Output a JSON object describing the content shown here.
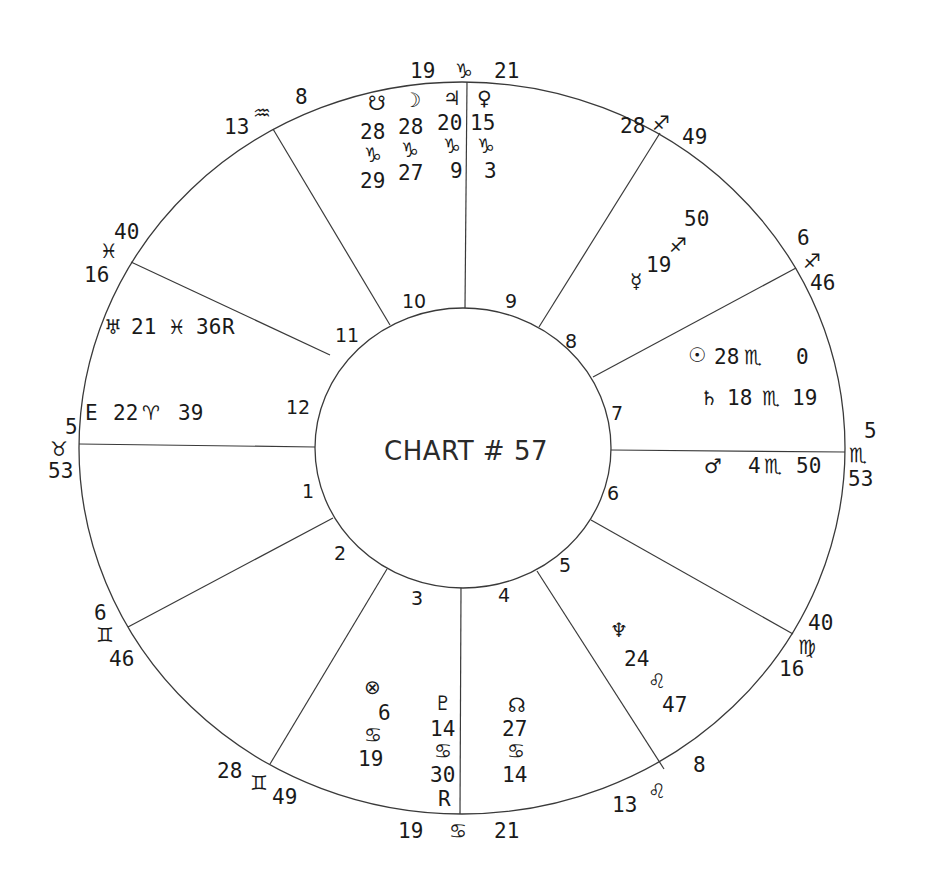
{
  "chart": {
    "title": "CHART # 57",
    "house_numbers": [
      "1",
      "2",
      "3",
      "4",
      "5",
      "6",
      "7",
      "8",
      "9",
      "10",
      "11",
      "12"
    ],
    "cusps": [
      {
        "house": 10,
        "deg": "19",
        "sign": "♑",
        "min": "21",
        "sign_name": "capricorn"
      },
      {
        "house": 9,
        "deg": "28",
        "sign": "♐",
        "min": "49",
        "sign_name": "sagittarius"
      },
      {
        "house": 8,
        "deg": "6",
        "sign": "♐",
        "min": "46",
        "sign_name": "sagittarius"
      },
      {
        "house": 7,
        "deg": "5",
        "sign": "♏",
        "min": "53",
        "sign_name": "scorpio"
      },
      {
        "house": 6,
        "deg": "40",
        "sign": "♍",
        "min": "16",
        "sign_name": "virgo"
      },
      {
        "house": 5,
        "deg": "13",
        "sign": "♌",
        "min": "8",
        "sign_name": "leo"
      },
      {
        "house": 4,
        "deg": "19",
        "sign": "♋",
        "min": "21",
        "sign_name": "cancer"
      },
      {
        "house": 3,
        "deg": "28",
        "sign": "♊",
        "min": "49",
        "sign_name": "gemini"
      },
      {
        "house": 2,
        "deg": "6",
        "sign": "♊",
        "min": "46",
        "sign_name": "gemini"
      },
      {
        "house": 1,
        "deg": "5",
        "sign": "♉",
        "min": "53",
        "sign_name": "taurus"
      },
      {
        "house": 12,
        "deg": "40",
        "sign": "♓",
        "min": "16",
        "sign_name": "pisces"
      },
      {
        "house": 11,
        "deg": "13",
        "sign": "♒",
        "min": "8",
        "sign_name": "aquarius"
      }
    ],
    "planets": {
      "south_node": {
        "glyph": "☋",
        "deg": "28",
        "sign": "♑",
        "min": "29"
      },
      "moon": {
        "glyph": "☽",
        "deg": "28",
        "sign": "♑",
        "min": "27"
      },
      "jupiter": {
        "glyph": "♃",
        "deg": "20",
        "sign": "♑",
        "min": "9"
      },
      "venus": {
        "glyph": "♀",
        "deg": "15",
        "sign": "♑",
        "min": "3"
      },
      "mercury": {
        "glyph": "☿",
        "deg": "19",
        "sign": "♐",
        "min": "50"
      },
      "sun": {
        "glyph": "☉",
        "deg": "28",
        "sign": "♏",
        "min": "0"
      },
      "saturn": {
        "glyph": "♄",
        "deg": "18",
        "sign": "♏",
        "min": "19"
      },
      "mars": {
        "glyph": "♂",
        "deg": "4",
        "sign": "♏",
        "min": "50"
      },
      "neptune": {
        "glyph": "♆",
        "deg": "24",
        "sign": "♌",
        "min": "47"
      },
      "north_node": {
        "glyph": "☊",
        "deg": "27",
        "sign": "♋",
        "min": "14"
      },
      "pluto": {
        "glyph": "♇",
        "deg": "14",
        "sign": "♋",
        "min": "30",
        "retro": "R"
      },
      "part_of_fortune": {
        "glyph": "⊗",
        "deg": "6",
        "sign": "♋",
        "min": "19"
      },
      "uranus": {
        "glyph": "♅",
        "deg": "21",
        "sign": "♓",
        "min": "36",
        "retro": "R"
      },
      "east_point": {
        "glyph": "E",
        "deg": "22",
        "sign": "♈",
        "min": "39"
      }
    }
  }
}
